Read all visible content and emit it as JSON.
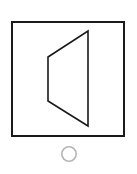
{
  "page": {
    "background_color": "#ffffff",
    "width": 137,
    "height": 174
  },
  "figure": {
    "name": "trapezoid-in-square",
    "description": "Line drawing: a square outline containing a trapezoid, with a small gray circle beneath",
    "frame": {
      "label": "square-frame",
      "x": 12,
      "y": 22,
      "width": 112,
      "height": 114,
      "stroke_color": "#1a1a1a",
      "stroke_width": 1.6,
      "fill_color": "#ffffff"
    },
    "shape": {
      "label": "trapezoid",
      "points": "48,57 88,31 88,126 48,101",
      "vertices": [
        {
          "name": "top-left",
          "x": 48,
          "y": 57
        },
        {
          "name": "top-right",
          "x": 88,
          "y": 31
        },
        {
          "name": "bottom-right",
          "x": 88,
          "y": 126
        },
        {
          "name": "bottom-left",
          "x": 48,
          "y": 101
        }
      ],
      "stroke_color": "#1a1a1a",
      "stroke_width": 1.6,
      "fill_color": "#ffffff"
    },
    "marker": {
      "label": "circle-marker",
      "cx": 69,
      "cy": 154,
      "r": 7.2,
      "stroke_color": "#b5b5b5",
      "stroke_width": 1.6,
      "fill_color": "none"
    }
  },
  "chart_data": {
    "type": "diagram",
    "title": "",
    "elements": [
      {
        "kind": "rectangle",
        "name": "square-frame",
        "x": 12,
        "y": 22,
        "width": 112,
        "height": 114,
        "stroke": "#1a1a1a",
        "fill": "#ffffff"
      },
      {
        "kind": "polygon",
        "name": "trapezoid",
        "points": [
          [
            48,
            57
          ],
          [
            88,
            31
          ],
          [
            88,
            126
          ],
          [
            48,
            101
          ]
        ],
        "stroke": "#1a1a1a",
        "fill": "#ffffff"
      },
      {
        "kind": "circle",
        "name": "circle-marker",
        "cx": 69,
        "cy": 154,
        "r": 7.2,
        "stroke": "#b5b5b5",
        "fill": "none"
      }
    ]
  }
}
